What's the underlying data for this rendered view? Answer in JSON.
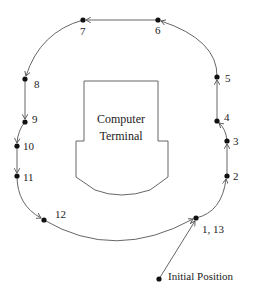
{
  "diagram": {
    "obstacle": {
      "label_line1": "Computer",
      "label_line2": "Terminal"
    },
    "waypoints": [
      {
        "id": "1",
        "label": "1, 13"
      },
      {
        "id": "2",
        "label": "2"
      },
      {
        "id": "3",
        "label": "3"
      },
      {
        "id": "4",
        "label": "4"
      },
      {
        "id": "5",
        "label": "5"
      },
      {
        "id": "6",
        "label": "6"
      },
      {
        "id": "7",
        "label": "7"
      },
      {
        "id": "8",
        "label": "8"
      },
      {
        "id": "9",
        "label": "9"
      },
      {
        "id": "10",
        "label": "10"
      },
      {
        "id": "11",
        "label": "11"
      },
      {
        "id": "12",
        "label": "12"
      }
    ],
    "start": {
      "label": "Initial Position"
    },
    "path_order": [
      "start",
      "1",
      "2",
      "3",
      "4",
      "5",
      "6",
      "7",
      "8",
      "9",
      "10",
      "11",
      "12",
      "13"
    ]
  }
}
